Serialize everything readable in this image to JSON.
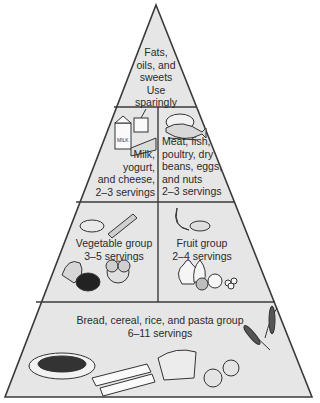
{
  "diagram": {
    "type": "food-pyramid",
    "colors": {
      "fill": "#e6e6e6",
      "stroke": "#3a3a3a",
      "text": "#2a2a2a"
    },
    "tiers": [
      {
        "name": "fats-oils-sweets",
        "label": "Fats,\noils, and\nsweets\nUse\nsparingly"
      },
      {
        "name": "dairy-and-protein",
        "left": {
          "label": "Milk,\nyogurt,\nand cheese,\n2–3 servings"
        },
        "right": {
          "label": "Meat, fish,\npoultry, dry\nbeans, eggs,\nand nuts\n2–3 servings"
        }
      },
      {
        "name": "vegetables-and-fruit",
        "left": {
          "label": "Vegetable group\n3–5 servings"
        },
        "right": {
          "label": "Fruit group\n2–4 servings"
        }
      },
      {
        "name": "grains",
        "label": "Bread, cereal, rice, and pasta group\n6–11 servings"
      }
    ]
  }
}
